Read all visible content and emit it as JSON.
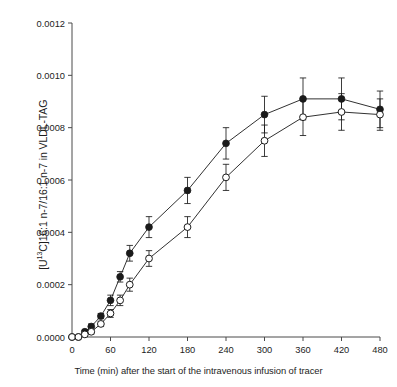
{
  "chart_data": {
    "type": "line",
    "title": "",
    "subtitle": "",
    "xlabel": "Time (min) after the start of the intravenous infusion of tracer",
    "ylabel_plain": "[U13C]16:1 n-7/16:1 n-7 in VLDL-TAG",
    "ylabel_prefix": "[U",
    "ylabel_superscript": "13",
    "ylabel_suffix": "C]16:1 n-7/16:1 n-7 in VLDL-TAG",
    "xlim": [
      0,
      480
    ],
    "ylim": [
      0.0,
      0.0012
    ],
    "xticks": [
      0,
      60,
      120,
      180,
      240,
      300,
      360,
      420,
      480
    ],
    "xticklabels": [
      "0",
      "60",
      "120",
      "180",
      "240",
      "300",
      "360",
      "420",
      "480"
    ],
    "yticks": [
      0.0,
      0.0002,
      0.0004,
      0.0006,
      0.0008,
      0.001,
      0.0012
    ],
    "yticklabels": [
      "0.0000",
      "0.0002",
      "0.0004",
      "0.0006",
      "0.0008",
      "0.0010",
      "0.0012"
    ],
    "grid": false,
    "legend": "none",
    "errorbars": "sem",
    "x": [
      0,
      10,
      20,
      30,
      45,
      60,
      75,
      90,
      120,
      180,
      240,
      300,
      360,
      420,
      480
    ],
    "series": [
      {
        "name": "filled-circle-series",
        "marker": "filled-circle",
        "color": "#1a1a1a",
        "values": [
          0.0,
          0.0,
          2e-05,
          4e-05,
          8e-05,
          0.00014,
          0.00023,
          0.00032,
          0.00042,
          0.00056,
          0.00074,
          0.00085,
          0.00091,
          0.00091,
          0.00087
        ],
        "errors": [
          0.0,
          0.0,
          5e-06,
          1e-05,
          1e-05,
          2e-05,
          2e-05,
          3e-05,
          4e-05,
          5e-05,
          6e-05,
          7e-05,
          8e-05,
          8e-05,
          7e-05
        ]
      },
      {
        "name": "open-circle-series",
        "marker": "open-circle",
        "color": "#1a1a1a",
        "values": [
          0.0,
          0.0,
          1e-05,
          2e-05,
          5e-05,
          9e-05,
          0.00014,
          0.0002,
          0.0003,
          0.00042,
          0.00061,
          0.00075,
          0.00084,
          0.00086,
          0.00085
        ],
        "errors": [
          0.0,
          0.0,
          5e-06,
          8e-06,
          1e-05,
          1.5e-05,
          2e-05,
          2.5e-05,
          3e-05,
          4e-05,
          5e-05,
          6e-05,
          7e-05,
          7e-05,
          6e-05
        ]
      }
    ]
  }
}
